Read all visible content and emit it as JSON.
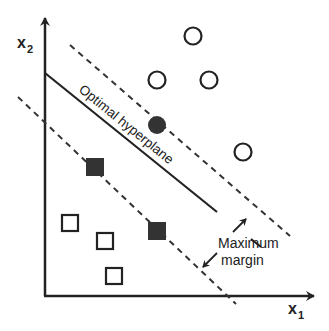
{
  "diagram": {
    "axes": {
      "x_label": "x",
      "x_subscript": "1",
      "y_label": "x",
      "y_subscript": "2"
    },
    "hyperplane_label": "Optimal hyperplane",
    "margin_label_line1": "Maximum",
    "margin_label_line2": "margin",
    "colors": {
      "stroke": "#222222",
      "fill_dark": "#333333",
      "background": "#ffffff"
    },
    "class_circles": {
      "open": [
        {
          "cx": 193,
          "cy": 36
        },
        {
          "cx": 157,
          "cy": 80
        },
        {
          "cx": 209,
          "cy": 80
        },
        {
          "cx": 243,
          "cy": 152
        }
      ],
      "support_vectors_filled": [
        {
          "cx": 157,
          "cy": 125
        }
      ]
    },
    "class_squares": {
      "open": [
        {
          "x": 70,
          "y": 223
        },
        {
          "x": 105,
          "y": 241
        },
        {
          "x": 114,
          "y": 276
        }
      ],
      "support_vectors_filled": [
        {
          "x": 95,
          "y": 167
        },
        {
          "x": 157,
          "y": 231
        }
      ]
    }
  }
}
